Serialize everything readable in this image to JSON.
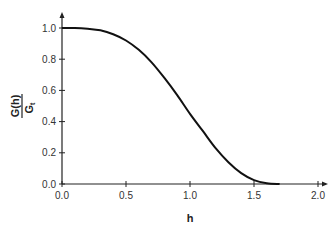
{
  "chart_data": {
    "type": "line",
    "title": "",
    "xlabel": "h",
    "ylabel": "G(h) / G_t",
    "ylabel_numerator": "G(h)",
    "ylabel_denominator": "G",
    "ylabel_denominator_sub": "t",
    "xlim": [
      0.0,
      2.0
    ],
    "ylim": [
      0.0,
      1.0
    ],
    "x_ticks": [
      "0.0",
      "0.5",
      "1.0",
      "1.5",
      "2.0"
    ],
    "y_ticks": [
      "0.0",
      "0.2",
      "0.4",
      "0.6",
      "0.8",
      "1.0"
    ],
    "grid": false,
    "legend": null,
    "series": [
      {
        "name": "G(h)/G_t",
        "x": [
          0.0,
          0.1,
          0.2,
          0.3,
          0.4,
          0.5,
          0.6,
          0.7,
          0.8,
          0.9,
          1.0,
          1.1,
          1.2,
          1.3,
          1.4,
          1.5,
          1.6,
          1.7
        ],
        "y": [
          1.0,
          1.0,
          0.995,
          0.985,
          0.96,
          0.92,
          0.86,
          0.78,
          0.68,
          0.57,
          0.45,
          0.34,
          0.23,
          0.14,
          0.07,
          0.025,
          0.005,
          0.0
        ]
      }
    ]
  }
}
